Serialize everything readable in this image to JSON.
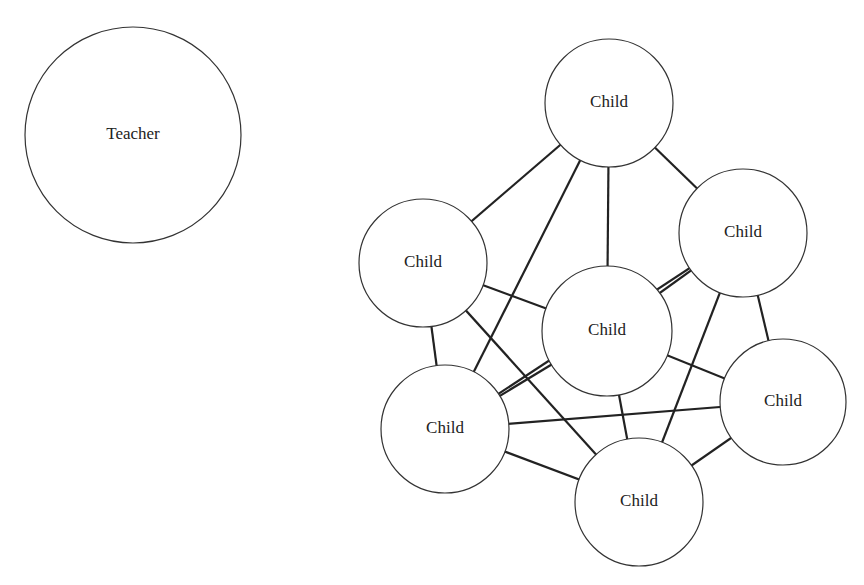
{
  "diagram": {
    "type": "sociogram",
    "nodes": [
      {
        "id": "teacher",
        "label": "Teacher",
        "cx": 133,
        "cy": 135,
        "r": 108
      },
      {
        "id": "child_top",
        "label": "Child",
        "cx": 609,
        "cy": 103,
        "r": 64
      },
      {
        "id": "child_upper_right",
        "label": "Child",
        "cx": 743,
        "cy": 233,
        "r": 64
      },
      {
        "id": "child_left",
        "label": "Child",
        "cx": 423,
        "cy": 263,
        "r": 64
      },
      {
        "id": "child_center",
        "label": "Child",
        "cx": 607,
        "cy": 331,
        "r": 65
      },
      {
        "id": "child_right",
        "label": "Child",
        "cx": 783,
        "cy": 402,
        "r": 63
      },
      {
        "id": "child_lower_left",
        "label": "Child",
        "cx": 445,
        "cy": 429,
        "r": 64
      },
      {
        "id": "child_bottom",
        "label": "Child",
        "cx": 639,
        "cy": 502,
        "r": 64
      }
    ],
    "edges": [
      [
        "child_top",
        "child_left"
      ],
      [
        "child_top",
        "child_lower_left"
      ],
      [
        "child_top",
        "child_center"
      ],
      [
        "child_top",
        "child_upper_right"
      ],
      [
        "child_upper_right",
        "child_lower_left"
      ],
      [
        "child_upper_right",
        "child_center"
      ],
      [
        "child_upper_right",
        "child_bottom"
      ],
      [
        "child_upper_right",
        "child_right"
      ],
      [
        "child_left",
        "child_center"
      ],
      [
        "child_left",
        "child_bottom"
      ],
      [
        "child_left",
        "child_lower_left"
      ],
      [
        "child_lower_left",
        "child_center"
      ],
      [
        "child_lower_left",
        "child_right"
      ],
      [
        "child_lower_left",
        "child_bottom"
      ],
      [
        "child_center",
        "child_bottom"
      ],
      [
        "child_center",
        "child_right"
      ],
      [
        "child_right",
        "child_bottom"
      ]
    ]
  }
}
